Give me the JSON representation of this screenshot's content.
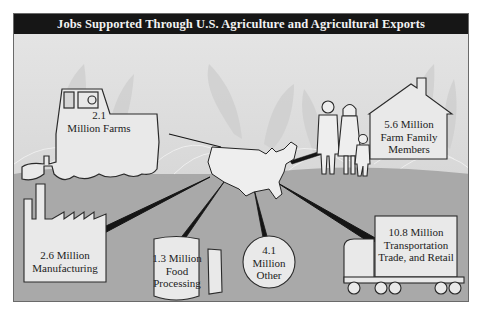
{
  "title": "Jobs Supported Through U.S. Agriculture and Agricultural Exports",
  "center": {
    "label": "United States map",
    "icon": "us-map-icon"
  },
  "categories": [
    {
      "id": "farms",
      "value": "2.1",
      "unit": "Million",
      "label": "Farms",
      "line1": "2.1",
      "line2": "Million Farms",
      "icon": "tractor-icon"
    },
    {
      "id": "family",
      "value": "5.6",
      "unit": "Million",
      "label": "Farm Family Members",
      "line1": "5.6 Million",
      "line2": "Farm Family",
      "line3": "Members",
      "icon": "house-family-icon"
    },
    {
      "id": "manufacturing",
      "value": "2.6",
      "unit": "Million",
      "label": "Manufacturing",
      "line1": "2.6 Million",
      "line2": "Manufacturing",
      "icon": "factory-icon"
    },
    {
      "id": "food",
      "value": "1.3",
      "unit": "Million",
      "label": "Food Processing",
      "line1": "1.3 Million",
      "line2": "Food",
      "line3": "Processing",
      "icon": "can-icon"
    },
    {
      "id": "other",
      "value": "4.1",
      "unit": "Million",
      "label": "Other",
      "line1": "4.1",
      "line2": "Million",
      "line3": "Other",
      "icon": "circle-icon"
    },
    {
      "id": "transport",
      "value": "10.8",
      "unit": "Million",
      "label": "Transportation Trade, and Retail",
      "line1": "10.8 Million",
      "line2": "Transportation",
      "line3": "Trade, and Retail",
      "icon": "truck-icon"
    }
  ],
  "colors": {
    "titlebar": "#161616",
    "sky": "#e6e6e6",
    "ground": "#a9a9a9",
    "shape_fill": "#e9e9e9",
    "outline": "#333333"
  }
}
